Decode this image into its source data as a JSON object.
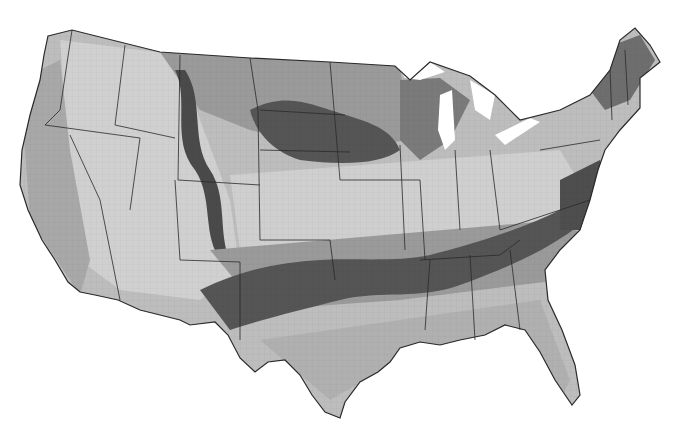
{
  "map": {
    "type": "choropleth-grayscale",
    "region": "contiguous-united-states",
    "labels": [],
    "background": "#ffffff",
    "palette": {
      "lightest": "#d9d9d9",
      "light": "#bdbdbd",
      "medium": "#9a9a9a",
      "dark": "#6e6e6e",
      "darkest": "#4a4a4a",
      "border": "#2a2a2a",
      "water": "#ffffff"
    }
  }
}
